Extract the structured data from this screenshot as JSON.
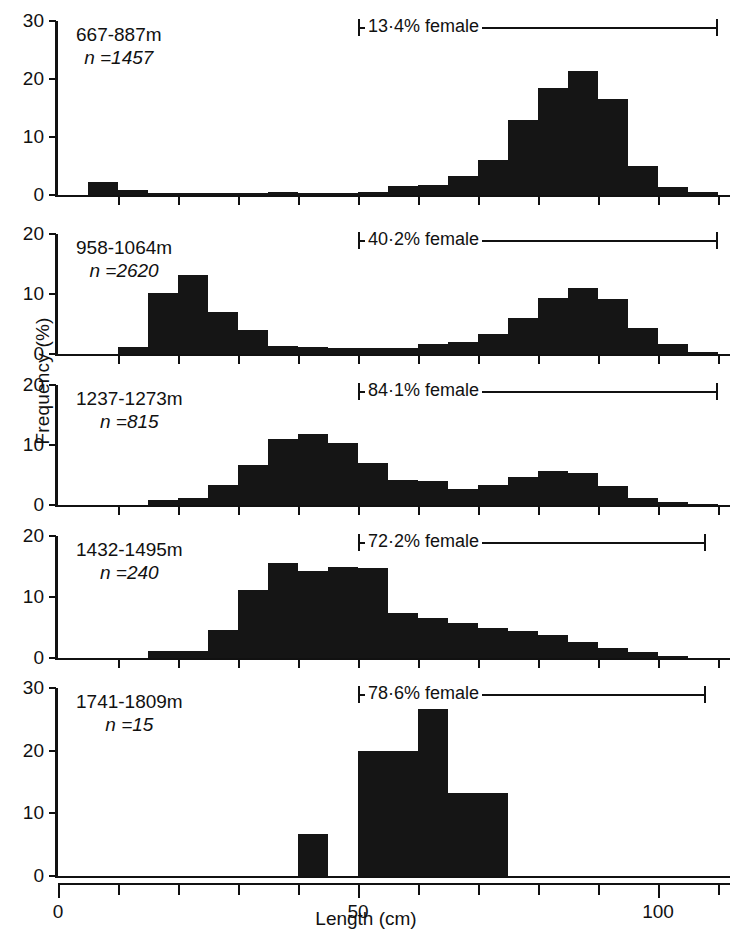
{
  "axes": {
    "ylabel": "Frequency (%)",
    "xlabel": "Length (cm)",
    "xticks_labeled": [
      "0",
      "50",
      "100"
    ],
    "xlim": [
      0,
      112
    ],
    "xtick_step": 5
  },
  "panels": [
    {
      "depth": "667-887m",
      "n_label": "n =1457",
      "female_label": "13·4% female",
      "ymax": 30,
      "yticks": [
        0,
        10,
        20,
        30
      ],
      "bracket_start_cm": 50,
      "bracket_end_cm": 110
    },
    {
      "depth": "958-1064m",
      "n_label": "n =2620",
      "female_label": "40·2% female",
      "ymax": 20,
      "yticks": [
        0,
        10,
        20
      ],
      "bracket_start_cm": 50,
      "bracket_end_cm": 110
    },
    {
      "depth": "1237-1273m",
      "n_label": "n =815",
      "female_label": "84·1% female",
      "ymax": 20,
      "yticks": [
        0,
        10,
        20
      ],
      "bracket_start_cm": 50,
      "bracket_end_cm": 110
    },
    {
      "depth": "1432-1495m",
      "n_label": "n =240",
      "female_label": "72·2% female",
      "ymax": 20,
      "yticks": [
        0,
        10,
        20
      ],
      "bracket_start_cm": 50,
      "bracket_end_cm": 108
    },
    {
      "depth": "1741-1809m",
      "n_label": "n =15",
      "female_label": "78·6% female",
      "ymax": 30,
      "yticks": [
        0,
        10,
        20,
        30
      ],
      "bracket_start_cm": 50,
      "bracket_end_cm": 108
    }
  ],
  "chart_data": {
    "type": "bar",
    "title": "",
    "xlabel": "Length (cm)",
    "ylabel": "Frequency (%)",
    "xlim": [
      0,
      112
    ],
    "bin_width_cm": 5,
    "grid": false,
    "legend": "none",
    "panels": [
      {
        "name": "667-887m",
        "n": 1457,
        "percent_female": 13.4,
        "ylim": [
          0,
          30
        ],
        "bins_start_cm": [
          5,
          10,
          15,
          20,
          25,
          30,
          35,
          40,
          45,
          50,
          55,
          60,
          65,
          70,
          75,
          80,
          85,
          90,
          95,
          100,
          105
        ],
        "values": [
          2.2,
          0.8,
          0.4,
          0.3,
          0.3,
          0.3,
          0.5,
          0.4,
          0.4,
          0.5,
          1.6,
          1.7,
          3.2,
          6.0,
          13.0,
          18.5,
          21.3,
          16.5,
          5.0,
          1.3,
          0.6
        ]
      },
      {
        "name": "958-1064m",
        "n": 2620,
        "percent_female": 40.2,
        "ylim": [
          0,
          20
        ],
        "bins_start_cm": [
          5,
          10,
          15,
          20,
          25,
          30,
          35,
          40,
          45,
          50,
          55,
          60,
          65,
          70,
          75,
          80,
          85,
          90,
          95,
          100,
          105
        ],
        "values": [
          0.0,
          1.2,
          10.2,
          13.2,
          7.0,
          4.0,
          1.3,
          1.2,
          1.0,
          1.0,
          1.0,
          1.6,
          2.0,
          3.4,
          6.0,
          9.3,
          11.0,
          9.2,
          4.3,
          1.6,
          0.4
        ]
      },
      {
        "name": "1237-1273m",
        "n": 815,
        "percent_female": 84.1,
        "ylim": [
          0,
          20
        ],
        "bins_start_cm": [
          5,
          10,
          15,
          20,
          25,
          30,
          35,
          40,
          45,
          50,
          55,
          60,
          65,
          70,
          75,
          80,
          85,
          90,
          95,
          100,
          105
        ],
        "values": [
          0.0,
          0.0,
          0.9,
          1.2,
          3.4,
          6.6,
          11.0,
          11.8,
          10.4,
          7.0,
          4.2,
          4.0,
          2.6,
          3.3,
          4.6,
          5.6,
          5.4,
          3.2,
          1.2,
          0.5,
          0.2
        ]
      },
      {
        "name": "1432-1495m",
        "n": 240,
        "percent_female": 72.2,
        "ylim": [
          0,
          20
        ],
        "bins_start_cm": [
          5,
          10,
          15,
          20,
          25,
          30,
          35,
          40,
          45,
          50,
          55,
          60,
          65,
          70,
          75,
          80,
          85,
          90,
          95,
          100,
          105
        ],
        "values": [
          0.0,
          0.0,
          1.2,
          1.2,
          4.6,
          11.2,
          15.5,
          14.2,
          15.0,
          14.8,
          7.4,
          6.6,
          5.8,
          5.0,
          4.4,
          3.8,
          2.6,
          1.7,
          1.0,
          0.4,
          0.0
        ]
      },
      {
        "name": "1741-1809m",
        "n": 15,
        "percent_female": 78.6,
        "ylim": [
          0,
          30
        ],
        "bins_start_cm": [
          5,
          10,
          15,
          20,
          25,
          30,
          35,
          40,
          45,
          50,
          55,
          60,
          65,
          70,
          75,
          80,
          85,
          90,
          95,
          100,
          105
        ],
        "values": [
          0,
          0,
          0,
          0,
          0,
          0,
          0,
          6.7,
          0,
          20.0,
          20.0,
          26.7,
          13.3,
          13.3,
          0,
          0,
          0,
          0,
          0,
          0,
          0
        ]
      }
    ]
  }
}
